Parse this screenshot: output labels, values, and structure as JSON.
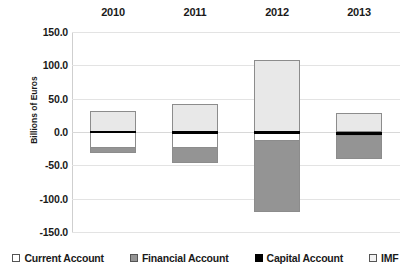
{
  "chart_data": {
    "type": "bar",
    "subtype": "stacked-diverging",
    "title": "",
    "xlabel": "",
    "ylabel": "Billions of Euros",
    "categories": [
      "2010",
      "2011",
      "2012",
      "2013"
    ],
    "ylim": [
      -150.0,
      150.0
    ],
    "ytick_labels": [
      "150.0",
      "100.0",
      "50.0",
      "0.0",
      "-50.0",
      "-100.0",
      "-150.0"
    ],
    "ytick_values": [
      150.0,
      100.0,
      50.0,
      0.0,
      -50.0,
      -100.0,
      -150.0
    ],
    "grid": true,
    "legend_position": "bottom",
    "series": [
      {
        "name": "Current Account",
        "color": "#ffffff",
        "values": [
          -23.0,
          -23.0,
          -4.0,
          0.0
        ]
      },
      {
        "name": "Financial Account",
        "color": "#949494",
        "values": [
          -9.0,
          -24.0,
          -108.0,
          -37.0
        ]
      },
      {
        "name": "Capital Account",
        "color": "#000000",
        "values": [
          2.0,
          2.0,
          2.0,
          2.0
        ]
      },
      {
        "name": "IMF",
        "color": "#e8e8e8",
        "values": [
          32.0,
          42.0,
          108.0,
          28.0
        ]
      }
    ],
    "bars": [
      {
        "category": "2010",
        "segments": [
          {
            "series": "IMF",
            "from": 0.0,
            "to": 32.0
          },
          {
            "series": "Capital Account",
            "from": -2.0,
            "to": 2.0
          },
          {
            "series": "Current Account",
            "from": -23.0,
            "to": -2.0
          },
          {
            "series": "Financial Account",
            "from": -32.0,
            "to": -23.0
          }
        ]
      },
      {
        "category": "2011",
        "segments": [
          {
            "series": "IMF",
            "from": 0.0,
            "to": 42.0
          },
          {
            "series": "Capital Account",
            "from": -3.0,
            "to": 1.0
          },
          {
            "series": "Current Account",
            "from": -23.0,
            "to": -3.0
          },
          {
            "series": "Financial Account",
            "from": -47.0,
            "to": -23.0
          }
        ]
      },
      {
        "category": "2012",
        "segments": [
          {
            "series": "IMF",
            "from": 0.0,
            "to": 108.0
          },
          {
            "series": "Capital Account",
            "from": -3.0,
            "to": 1.0
          },
          {
            "series": "Current Account",
            "from": -12.0,
            "to": -3.0
          },
          {
            "series": "Financial Account",
            "from": -120.0,
            "to": -12.0
          }
        ]
      },
      {
        "category": "2013",
        "segments": [
          {
            "series": "IMF",
            "from": 0.0,
            "to": 28.0
          },
          {
            "series": "Capital Account",
            "from": -4.0,
            "to": 0.0
          },
          {
            "series": "Financial Account",
            "from": -40.0,
            "to": -4.0
          }
        ]
      }
    ],
    "legend": [
      {
        "label": "Current Account",
        "swatch": "white"
      },
      {
        "label": "Financial Account",
        "swatch": "gray"
      },
      {
        "label": "Capital Account",
        "swatch": "black"
      },
      {
        "label": "IMF",
        "swatch": "light"
      }
    ]
  }
}
